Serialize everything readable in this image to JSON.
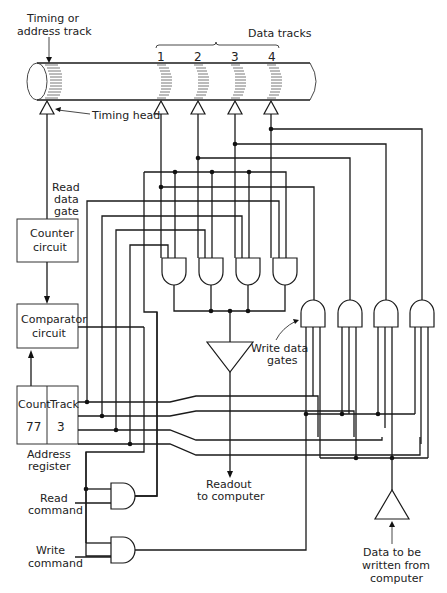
{
  "labels": {
    "timing_track": [
      "Timing or",
      "address track"
    ],
    "data_tracks": "Data tracks",
    "track_numbers": [
      "1",
      "2",
      "3",
      "4"
    ],
    "timing_head": "Timing head",
    "read_data_gate": [
      "Read",
      "data",
      "gate"
    ],
    "counter_circuit": [
      "Counter",
      "circuit"
    ],
    "comparator_circuit": [
      "Comparator",
      "circuit"
    ],
    "register": {
      "count_label": "Count",
      "count_value": "77",
      "track_label": "Track",
      "track_value": "3"
    },
    "address_register": [
      "Address",
      "register"
    ],
    "read_command": [
      "Read",
      "command"
    ],
    "write_command": [
      "Write",
      "command"
    ],
    "write_data_gates": [
      "Write data",
      "gates"
    ],
    "readout": [
      "Readout",
      "to computer"
    ],
    "data_in": [
      "Data to be",
      "written from",
      "computer"
    ]
  }
}
